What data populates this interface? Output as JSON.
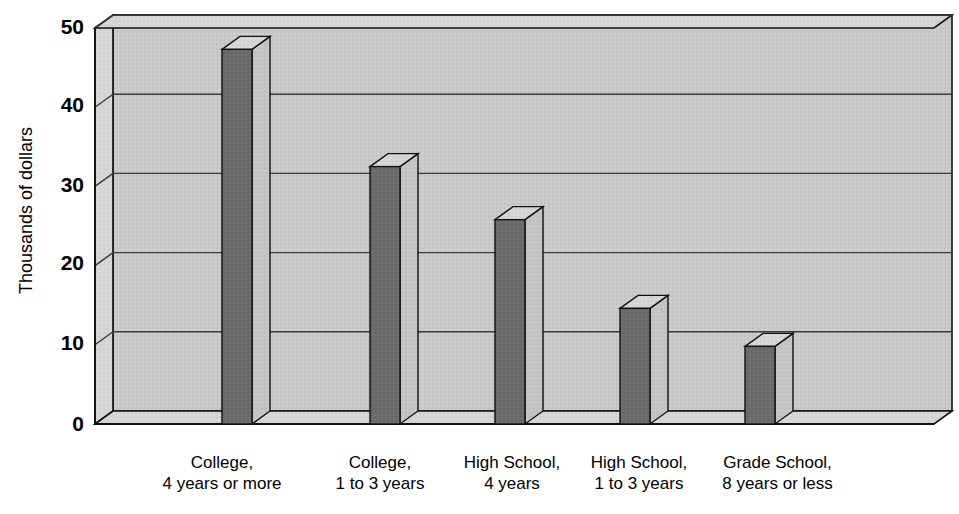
{
  "chart_data": {
    "type": "bar",
    "title": "",
    "subtitle": "",
    "xlabel": "",
    "ylabel": "Thousands of dollars",
    "ylim": [
      0,
      50
    ],
    "yticks": [
      0,
      10,
      20,
      30,
      40,
      50
    ],
    "ytick_labels": [
      "0",
      "10",
      "20",
      "30",
      "40",
      "50"
    ],
    "grid": true,
    "grid_axis": "y",
    "legend": false,
    "legend_position": "none",
    "style": "3d-bar",
    "categories": [
      "College, 4 years or more",
      "College, 1 to 3 years",
      "High School, 4 years",
      "High School, 1 to 3 years",
      "Grade School, 8 years or less"
    ],
    "category_lines": [
      [
        "College,",
        "4 years or more"
      ],
      [
        "College,",
        "1 to 3 years"
      ],
      [
        "High School,",
        "4 years"
      ],
      [
        "High School,",
        "1 to 3 years"
      ],
      [
        "Grade School,",
        "8 years or less"
      ]
    ],
    "values": [
      47.3,
      32.5,
      25.8,
      14.6,
      9.8
    ],
    "annotations": []
  },
  "colors": {
    "bar_front": "#6b6b6b",
    "bar_top": "#d2d2d2",
    "bar_side": "#bdbdbd",
    "plot_background": "#c9c9c9",
    "wall_left": "#d8d8d8",
    "floor": "#c0c0c0",
    "grid_line": "#3a3a3a",
    "outline": "#111111",
    "page_background": "#ffffff",
    "text": "#000000"
  },
  "axis_geometry": {
    "plot_left": 95,
    "plot_right": 934,
    "baseline_y": 424,
    "top_y": 28,
    "depth_dx": 18,
    "depth_dy": -13,
    "bar_width": 30,
    "bar_front_x": [
      222,
      370,
      495,
      620,
      745
    ]
  }
}
